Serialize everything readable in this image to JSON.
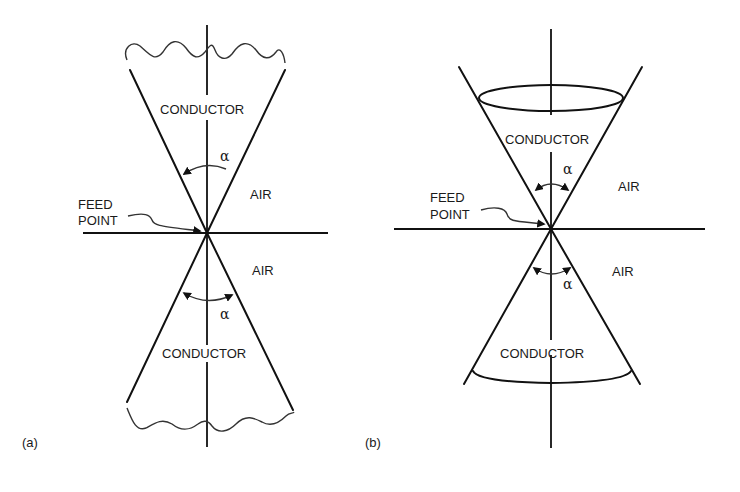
{
  "figure": {
    "panels": [
      {
        "id": "a",
        "caption": "(a)",
        "type": "infinite biconical antenna",
        "labels": {
          "conductor_top": "CONDUCTOR",
          "conductor_bottom": "CONDUCTOR",
          "air_upper": "AIR",
          "air_lower": "AIR",
          "feed_line1": "FEED",
          "feed_line2": "POINT",
          "angle_top": "α",
          "angle_bottom": "α"
        }
      },
      {
        "id": "b",
        "caption": "(b)",
        "type": "finite biconical antenna",
        "labels": {
          "conductor_top": "CONDUCTOR",
          "conductor_bottom": "CONDUCTOR",
          "air_upper": "AIR",
          "air_lower": "AIR",
          "feed_line1": "FEED",
          "feed_line2": "POINT",
          "angle_top": "α",
          "angle_bottom": "α"
        }
      }
    ],
    "colors": {
      "line": "#111111",
      "text": "#1a1a1a",
      "background": "#ffffff"
    }
  }
}
